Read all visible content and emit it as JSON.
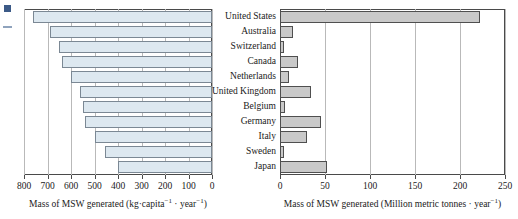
{
  "figure": {
    "type": "paired-horizontal-bar",
    "categories": [
      "United States",
      "Australia",
      "Switzerland",
      "Canada",
      "Netherlands",
      "United Kingdom",
      "Belgium",
      "Germany",
      "Italy",
      "Sweden",
      "Japan"
    ]
  },
  "left_chart": {
    "axis_title_main": "Mass of MSW generated (kg·capita",
    "axis_title_sup1": "−1",
    "axis_title_mid": " · year",
    "axis_title_sup2": "−1",
    "axis_title_end": ")",
    "ticks": [
      "800",
      "700",
      "600",
      "500",
      "400",
      "300",
      "200",
      "100",
      "0"
    ],
    "reversed": true
  },
  "right_chart": {
    "axis_title_main": "Mass of MSW generated (Million metric tonnes · year",
    "axis_title_sup1": "−1",
    "axis_title_end": ")",
    "ticks": [
      "0",
      "50",
      "100",
      "150",
      "200",
      "250"
    ],
    "reversed": false
  },
  "labels": {
    "united_states": "United States",
    "australia": "Australia",
    "switzerland": "Switzerland",
    "canada": "Canada",
    "netherlands": "Netherlands",
    "united_kingdom": "United Kingdom",
    "belgium": "Belgium",
    "germany": "Germany",
    "italy": "Italy",
    "sweden": "Sweden",
    "japan": "Japan"
  },
  "chart_data": [
    {
      "type": "bar",
      "orientation": "horizontal",
      "panel": "left",
      "title": "",
      "xlabel": "Mass of MSW generated (kg·capita⁻¹ · year⁻¹)",
      "ylabel": "",
      "xlim": [
        800,
        0
      ],
      "x_ticks": [
        800,
        700,
        600,
        500,
        400,
        300,
        200,
        100,
        0
      ],
      "x_axis_reversed": true,
      "grid": true,
      "bar_color": "#dde8f0",
      "bar_edge_color": "#7b8894",
      "categories": [
        "United States",
        "Australia",
        "Switzerland",
        "Canada",
        "Netherlands",
        "United Kingdom",
        "Belgium",
        "Germany",
        "Italy",
        "Sweden",
        "Japan"
      ],
      "values": [
        760,
        690,
        650,
        640,
        600,
        560,
        550,
        540,
        500,
        455,
        400
      ],
      "units": "kg per capita per year"
    },
    {
      "type": "bar",
      "orientation": "horizontal",
      "panel": "right",
      "title": "",
      "xlabel": "Mass of MSW generated (Million metric tonnes · year⁻¹)",
      "ylabel": "",
      "xlim": [
        0,
        250
      ],
      "x_ticks": [
        0,
        50,
        100,
        150,
        200,
        250
      ],
      "x_axis_reversed": false,
      "grid": true,
      "bar_color": "#c9c9c9",
      "bar_edge_color": "#4f4f4f",
      "categories": [
        "United States",
        "Australia",
        "Switzerland",
        "Canada",
        "Netherlands",
        "United Kingdom",
        "Belgium",
        "Germany",
        "Italy",
        "Sweden",
        "Japan"
      ],
      "values": [
        222,
        14,
        4,
        20,
        10,
        34,
        5,
        45,
        30,
        4,
        52
      ],
      "units": "Million metric tonnes per year"
    }
  ],
  "colors": {
    "left_bar_fill": "#dde8f0",
    "left_bar_edge": "#7b8894",
    "right_bar_fill": "#c9c9c9",
    "right_bar_edge": "#4f4f4f",
    "gridline": "#b9b9b9",
    "axis": "#4a4a4a",
    "background": "#ffffff"
  }
}
